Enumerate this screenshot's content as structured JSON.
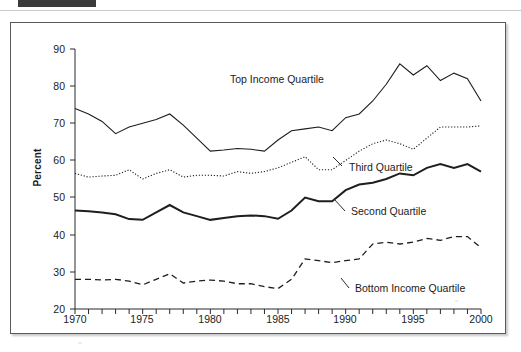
{
  "page_header": {
    "tab_block": "",
    "ghost_text_left": "",
    "ghost_text_right": ""
  },
  "axis": {
    "ylabel": "Percent",
    "y_ticks": [
      "90",
      "80",
      "70",
      "60",
      "50",
      "40",
      "30",
      "20"
    ],
    "x_ticks": [
      "1970",
      "1975",
      "1980",
      "1985",
      "1990",
      "1995",
      "2000"
    ]
  },
  "labels": {
    "top": "Top Income Quartile",
    "third": "Third Quartile",
    "second": "Second Quartile",
    "bottom": "Bottom Income Quartile"
  },
  "chart_data": {
    "type": "line",
    "title": "",
    "subtitle": "",
    "xlabel": "",
    "ylabel": "Percent",
    "xlim": [
      1970,
      2000
    ],
    "ylim": [
      20,
      90
    ],
    "y_tick_values": [
      20,
      30,
      40,
      50,
      60,
      70,
      80,
      90
    ],
    "x_tick_values": [
      1970,
      1975,
      1980,
      1985,
      1990,
      1995,
      2000
    ],
    "x_minor_tick_interval": 1,
    "grid": false,
    "legend": "inline-annotations",
    "x": [
      1970,
      1971,
      1972,
      1973,
      1974,
      1975,
      1976,
      1977,
      1978,
      1979,
      1980,
      1981,
      1982,
      1983,
      1984,
      1985,
      1986,
      1987,
      1988,
      1989,
      1990,
      1991,
      1992,
      1993,
      1994,
      1995,
      1996,
      1997,
      1998,
      1999,
      2000
    ],
    "series": [
      {
        "name": "Top Income Quartile",
        "style": "solid",
        "values": [
          74.0,
          72.5,
          70.5,
          67.2,
          69.0,
          70.0,
          71.0,
          72.5,
          69.5,
          66.0,
          62.5,
          62.8,
          63.2,
          63.0,
          62.5,
          65.5,
          68.0,
          68.5,
          69.0,
          68.0,
          71.5,
          72.5,
          76.0,
          80.5,
          86.0,
          83.0,
          85.5,
          81.5,
          83.5,
          82.0,
          76.0
        ]
      },
      {
        "name": "Third Quartile",
        "style": "dotted",
        "values": [
          56.5,
          55.5,
          55.8,
          56.0,
          57.5,
          55.0,
          56.5,
          57.5,
          55.5,
          56.0,
          56.0,
          55.8,
          57.0,
          56.5,
          57.0,
          58.0,
          59.5,
          61.0,
          57.5,
          57.5,
          60.0,
          62.5,
          64.5,
          65.5,
          64.5,
          63.0,
          66.0,
          69.0,
          69.0,
          69.0,
          69.3
        ]
      },
      {
        "name": "Second Quartile",
        "style": "solid-thick",
        "values": [
          46.5,
          46.3,
          46.0,
          45.5,
          44.2,
          44.0,
          46.0,
          48.0,
          46.0,
          45.0,
          44.0,
          44.5,
          45.0,
          45.2,
          45.0,
          44.3,
          46.5,
          50.0,
          49.0,
          49.0,
          52.0,
          53.5,
          54.0,
          55.0,
          56.5,
          56.0,
          58.0,
          59.0,
          58.0,
          59.0,
          57.0
        ]
      },
      {
        "name": "Bottom Income Quartile",
        "style": "dashed",
        "values": [
          28.0,
          28.0,
          27.8,
          28.0,
          27.5,
          26.5,
          28.0,
          29.5,
          27.0,
          27.5,
          27.8,
          27.5,
          26.8,
          26.8,
          26.0,
          25.5,
          28.0,
          33.5,
          33.0,
          32.5,
          33.0,
          33.5,
          37.5,
          38.0,
          37.5,
          38.0,
          39.0,
          38.5,
          39.5,
          39.5,
          36.5
        ]
      }
    ]
  }
}
